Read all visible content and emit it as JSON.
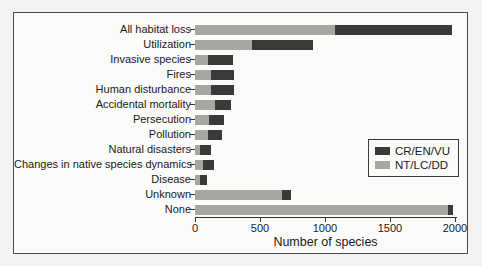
{
  "figure": {
    "title": "",
    "xlabel": "Number of species"
  },
  "chart_data": {
    "type": "bar",
    "orientation": "horizontal",
    "stacked": true,
    "title": "",
    "xlabel": "Number of species",
    "ylabel": "",
    "xlim": [
      0,
      2000
    ],
    "x_ticks": [
      0,
      500,
      1000,
      1500,
      2000
    ],
    "grid": false,
    "legend_position": "right-middle",
    "categories": [
      "All habitat loss",
      "Utilization",
      "Invasive species",
      "Fires",
      "Human disturbance",
      "Accidental mortality",
      "Persecution",
      "Pollution",
      "Natural disasters",
      "Changes in native species dynamics",
      "Disease",
      "Unknown",
      "None"
    ],
    "series": [
      {
        "name": "NT/LC/DD",
        "color": "#a8a6a3",
        "values": [
          1080,
          440,
          100,
          125,
          125,
          155,
          110,
          100,
          40,
          60,
          40,
          670,
          1945
        ]
      },
      {
        "name": "CR/EN/VU",
        "color": "#3a3a3a",
        "values": [
          895,
          465,
          190,
          175,
          175,
          125,
          115,
          105,
          80,
          85,
          50,
          70,
          40
        ]
      }
    ],
    "totals": [
      1975,
      905,
      290,
      300,
      300,
      280,
      225,
      205,
      120,
      145,
      90,
      740,
      1985
    ],
    "legend": [
      {
        "label": "CR/EN/VU",
        "color": "#3a3a3a"
      },
      {
        "label": "NT/LC/DD",
        "color": "#a8a6a3"
      }
    ]
  }
}
